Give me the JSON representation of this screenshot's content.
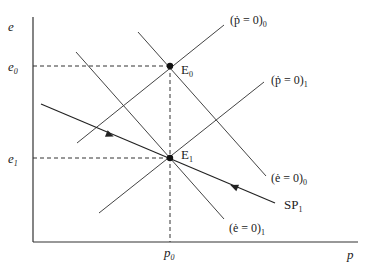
{
  "diagram": {
    "title": "",
    "axes": {
      "x_label": "p",
      "y_label": "e"
    },
    "ticks": {
      "p0": "p",
      "p0_sub": "0",
      "e0": "e",
      "e0_sub": "0",
      "e1": "e",
      "e1_sub": "1"
    },
    "points": {
      "E0": {
        "label": "E",
        "sub": "0"
      },
      "E1": {
        "label": "E",
        "sub": "1"
      }
    },
    "curves": {
      "pdot0": {
        "label": "(ṗ = 0)",
        "sub": "0"
      },
      "pdot1": {
        "label": "(ṗ = 0)",
        "sub": "1"
      },
      "edot0": {
        "label": "(ė = 0)",
        "sub": "0"
      },
      "edot1": {
        "label": "(ė = 0)",
        "sub": "1"
      },
      "sp1": {
        "label": "SP",
        "sub": "1"
      }
    },
    "colors": {
      "line": "#333333",
      "axis": "#333333"
    }
  }
}
